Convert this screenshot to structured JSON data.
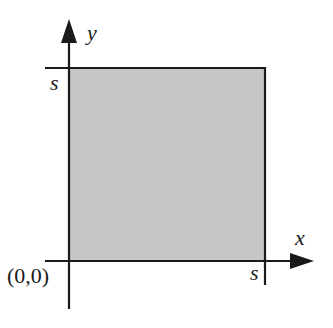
{
  "diagram": {
    "type": "coordinate-square",
    "colors": {
      "fill": "#c6c6c6",
      "stroke": "#1a1a1a",
      "background": "#ffffff"
    },
    "axes": {
      "x": {
        "label": "x"
      },
      "y": {
        "label": "y"
      }
    },
    "origin": {
      "label": "(0,0)"
    },
    "square": {
      "side_label_x": "s",
      "side_label_y": "s"
    }
  }
}
